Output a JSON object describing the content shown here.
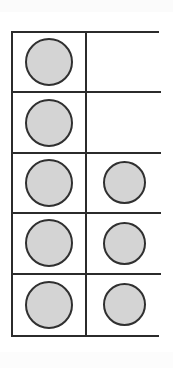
{
  "figure": {
    "kind": "counter-grid",
    "columns": 2,
    "rows": 5,
    "total_cells": 10,
    "filled_count": 8,
    "empty_count": 2,
    "colors": {
      "disc_fill": "#d4d4d4",
      "disc_outline": "#303030",
      "grid_line": "#2b2b2b",
      "cell_background": "#ffffff",
      "page_background": "#ffffff"
    }
  },
  "chart_data": {
    "type": "table",
    "title": "",
    "xlabel": "",
    "ylabel": "",
    "categories": [
      "Column 1",
      "Column 2"
    ],
    "values": [
      5,
      3
    ],
    "grid": true,
    "legend": "none",
    "cells": [
      [
        {
          "row": 1,
          "col": 1,
          "filled": true,
          "icon": "gray-disc",
          "size": "large"
        },
        {
          "row": 1,
          "col": 2,
          "filled": false,
          "icon": "",
          "size": ""
        }
      ],
      [
        {
          "row": 2,
          "col": 1,
          "filled": true,
          "icon": "gray-disc",
          "size": "large"
        },
        {
          "row": 2,
          "col": 2,
          "filled": false,
          "icon": "",
          "size": ""
        }
      ],
      [
        {
          "row": 3,
          "col": 1,
          "filled": true,
          "icon": "gray-disc",
          "size": "large"
        },
        {
          "row": 3,
          "col": 2,
          "filled": true,
          "icon": "gray-disc",
          "size": "small"
        }
      ],
      [
        {
          "row": 4,
          "col": 1,
          "filled": true,
          "icon": "gray-disc",
          "size": "large"
        },
        {
          "row": 4,
          "col": 2,
          "filled": true,
          "icon": "gray-disc",
          "size": "small"
        }
      ],
      [
        {
          "row": 5,
          "col": 1,
          "filled": true,
          "icon": "gray-disc",
          "size": "large"
        },
        {
          "row": 5,
          "col": 2,
          "filled": true,
          "icon": "gray-disc",
          "size": "small"
        }
      ]
    ]
  }
}
